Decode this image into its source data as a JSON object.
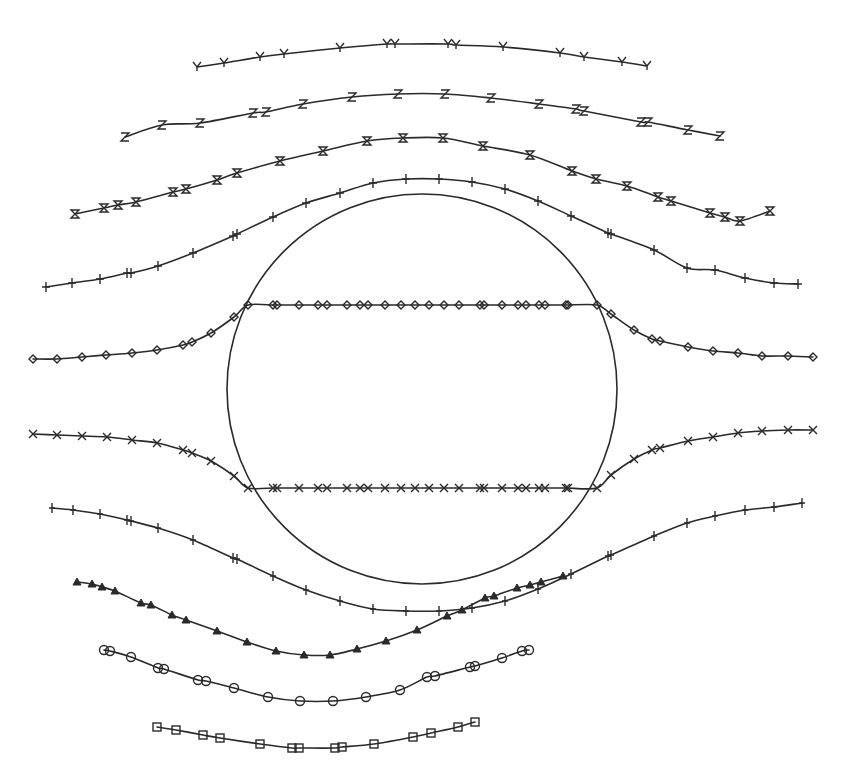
{
  "figure": {
    "background": "#ffffff",
    "ink": "#2a2a2a",
    "cylinder": {
      "cx": 422,
      "cy": 389,
      "r": 195
    },
    "streamlines": [
      {
        "id": "y",
        "marker": "Y",
        "points": [
          [
            197,
            67
          ],
          [
            224,
            63
          ],
          [
            260,
            57
          ],
          [
            284,
            54
          ],
          [
            340,
            48
          ],
          [
            387,
            44
          ],
          [
            395,
            44
          ],
          [
            448,
            44
          ],
          [
            456,
            45
          ],
          [
            503,
            47
          ],
          [
            560,
            53
          ],
          [
            584,
            57
          ],
          [
            622,
            62
          ],
          [
            647,
            66
          ]
        ]
      },
      {
        "id": "z",
        "marker": "Z",
        "points": [
          [
            125,
            137
          ],
          [
            162,
            125
          ],
          [
            200,
            123
          ],
          [
            253,
            113
          ],
          [
            266,
            112
          ],
          [
            303,
            104
          ],
          [
            352,
            97
          ],
          [
            398,
            94
          ],
          [
            445,
            94
          ],
          [
            491,
            98
          ],
          [
            539,
            104
          ],
          [
            576,
            109
          ],
          [
            584,
            111
          ],
          [
            641,
            122
          ],
          [
            648,
            122
          ],
          [
            688,
            130
          ],
          [
            720,
            136
          ]
        ]
      },
      {
        "id": "hourglass",
        "marker": "hourglass",
        "points": [
          [
            75,
            214
          ],
          [
            104,
            208
          ],
          [
            118,
            205
          ],
          [
            136,
            202
          ],
          [
            173,
            192
          ],
          [
            186,
            189
          ],
          [
            217,
            180
          ],
          [
            237,
            173
          ],
          [
            280,
            161
          ],
          [
            323,
            151
          ],
          [
            367,
            141
          ],
          [
            403,
            138
          ],
          [
            443,
            138
          ],
          [
            483,
            146
          ],
          [
            530,
            155
          ],
          [
            572,
            171
          ],
          [
            596,
            179
          ],
          [
            627,
            186
          ],
          [
            658,
            197
          ],
          [
            671,
            201
          ],
          [
            710,
            213
          ],
          [
            725,
            217
          ],
          [
            740,
            221
          ],
          [
            770,
            211
          ]
        ]
      },
      {
        "id": "plus-heavy",
        "marker": "plus-bold",
        "points": [
          [
            46,
            287
          ],
          [
            72,
            283
          ],
          [
            100,
            279
          ],
          [
            127,
            273
          ],
          [
            131,
            273
          ],
          [
            158,
            266
          ],
          [
            193,
            253
          ],
          [
            233,
            236
          ],
          [
            237,
            234
          ],
          [
            273,
            217
          ],
          [
            306,
            203
          ],
          [
            340,
            193
          ],
          [
            373,
            183
          ],
          [
            406,
            179
          ],
          [
            439,
            179
          ],
          [
            472,
            182
          ],
          [
            505,
            189
          ],
          [
            538,
            201
          ],
          [
            571,
            216
          ],
          [
            608,
            233
          ],
          [
            611,
            234
          ],
          [
            654,
            250
          ],
          [
            687,
            268
          ],
          [
            715,
            270
          ],
          [
            745,
            278
          ],
          [
            774,
            283
          ],
          [
            798,
            284
          ]
        ]
      },
      {
        "id": "diamond",
        "marker": "diamond",
        "points": [
          [
            33,
            359
          ],
          [
            57,
            359
          ],
          [
            82,
            357
          ],
          [
            106,
            355
          ],
          [
            132,
            353
          ],
          [
            157,
            350
          ],
          [
            183,
            345
          ],
          [
            192,
            342
          ],
          [
            211,
            333
          ],
          [
            234,
            317
          ],
          [
            248,
            305
          ],
          [
            273,
            305
          ],
          [
            277,
            305
          ],
          [
            299,
            305
          ],
          [
            318,
            305
          ],
          [
            327,
            305
          ],
          [
            347,
            305
          ],
          [
            360,
            305
          ],
          [
            368,
            305
          ],
          [
            385,
            305
          ],
          [
            401,
            305
          ],
          [
            415,
            305
          ],
          [
            429,
            305
          ],
          [
            444,
            305
          ],
          [
            459,
            305
          ],
          [
            480,
            305
          ],
          [
            484,
            305
          ],
          [
            502,
            305
          ],
          [
            518,
            305
          ],
          [
            526,
            305
          ],
          [
            539,
            305
          ],
          [
            545,
            305
          ],
          [
            566,
            305
          ],
          [
            568,
            305
          ],
          [
            597,
            305
          ],
          [
            611,
            314
          ],
          [
            634,
            330
          ],
          [
            652,
            339
          ],
          [
            660,
            341
          ],
          [
            688,
            347
          ],
          [
            713,
            351
          ],
          [
            738,
            353
          ],
          [
            762,
            356
          ],
          [
            788,
            356
          ],
          [
            813,
            357
          ]
        ]
      },
      {
        "id": "x",
        "marker": "X",
        "points": [
          [
            33,
            434
          ],
          [
            57,
            435
          ],
          [
            82,
            436
          ],
          [
            107,
            437
          ],
          [
            132,
            440
          ],
          [
            157,
            443
          ],
          [
            183,
            450
          ],
          [
            192,
            453
          ],
          [
            211,
            461
          ],
          [
            234,
            476
          ],
          [
            248,
            488
          ],
          [
            273,
            488
          ],
          [
            277,
            488
          ],
          [
            299,
            488
          ],
          [
            318,
            488
          ],
          [
            327,
            488
          ],
          [
            347,
            488
          ],
          [
            360,
            488
          ],
          [
            368,
            488
          ],
          [
            385,
            488
          ],
          [
            401,
            488
          ],
          [
            415,
            488
          ],
          [
            429,
            488
          ],
          [
            444,
            488
          ],
          [
            459,
            488
          ],
          [
            480,
            488
          ],
          [
            484,
            488
          ],
          [
            502,
            488
          ],
          [
            518,
            488
          ],
          [
            526,
            488
          ],
          [
            539,
            488
          ],
          [
            545,
            488
          ],
          [
            566,
            488
          ],
          [
            568,
            488
          ],
          [
            597,
            488
          ],
          [
            611,
            475
          ],
          [
            634,
            459
          ],
          [
            652,
            450
          ],
          [
            660,
            448
          ],
          [
            688,
            441
          ],
          [
            713,
            437
          ],
          [
            738,
            433
          ],
          [
            762,
            431
          ],
          [
            788,
            430
          ],
          [
            813,
            430
          ]
        ]
      },
      {
        "id": "plus",
        "marker": "plus",
        "points": [
          [
            52,
            508
          ],
          [
            73,
            510
          ],
          [
            100,
            514
          ],
          [
            127,
            520
          ],
          [
            131,
            521
          ],
          [
            158,
            528
          ],
          [
            193,
            540
          ],
          [
            233,
            558
          ],
          [
            237,
            559
          ],
          [
            273,
            576
          ],
          [
            306,
            590
          ],
          [
            340,
            601
          ],
          [
            373,
            609
          ],
          [
            406,
            611
          ],
          [
            439,
            611
          ],
          [
            472,
            608
          ],
          [
            505,
            601
          ],
          [
            538,
            589
          ],
          [
            571,
            574
          ],
          [
            608,
            556
          ],
          [
            611,
            555
          ],
          [
            654,
            536
          ],
          [
            687,
            523
          ],
          [
            715,
            516
          ],
          [
            745,
            510
          ],
          [
            774,
            507
          ],
          [
            802,
            503
          ]
        ]
      },
      {
        "id": "triangle",
        "marker": "triangle",
        "points": [
          [
            77,
            582
          ],
          [
            92,
            584
          ],
          [
            102,
            587
          ],
          [
            115,
            591
          ],
          [
            141,
            603
          ],
          [
            151,
            605
          ],
          [
            172,
            615
          ],
          [
            186,
            620
          ],
          [
            217,
            631
          ],
          [
            247,
            642
          ],
          [
            276,
            651
          ],
          [
            304,
            655
          ],
          [
            330,
            655
          ],
          [
            357,
            649
          ],
          [
            386,
            641
          ],
          [
            417,
            630
          ],
          [
            447,
            616
          ],
          [
            462,
            610
          ],
          [
            485,
            598
          ],
          [
            494,
            596
          ],
          [
            517,
            588
          ],
          [
            530,
            585
          ],
          [
            541,
            582
          ],
          [
            563,
            576
          ]
        ]
      },
      {
        "id": "circle",
        "marker": "circle",
        "points": [
          [
            104,
            650
          ],
          [
            110,
            651
          ],
          [
            131,
            657
          ],
          [
            158,
            668
          ],
          [
            164,
            669
          ],
          [
            198,
            680
          ],
          [
            206,
            681
          ],
          [
            234,
            688
          ],
          [
            268,
            697
          ],
          [
            300,
            701
          ],
          [
            333,
            701
          ],
          [
            366,
            697
          ],
          [
            400,
            690
          ],
          [
            427,
            677
          ],
          [
            435,
            676
          ],
          [
            470,
            667
          ],
          [
            475,
            666
          ],
          [
            502,
            658
          ],
          [
            522,
            651
          ],
          [
            529,
            650
          ]
        ]
      },
      {
        "id": "square",
        "marker": "square",
        "points": [
          [
            157,
            727
          ],
          [
            176,
            730
          ],
          [
            203,
            735
          ],
          [
            220,
            738
          ],
          [
            260,
            744
          ],
          [
            292,
            748
          ],
          [
            299,
            748
          ],
          [
            335,
            748
          ],
          [
            342,
            747
          ],
          [
            374,
            744
          ],
          [
            413,
            737
          ],
          [
            431,
            733
          ],
          [
            458,
            727
          ],
          [
            475,
            722
          ]
        ]
      }
    ]
  }
}
